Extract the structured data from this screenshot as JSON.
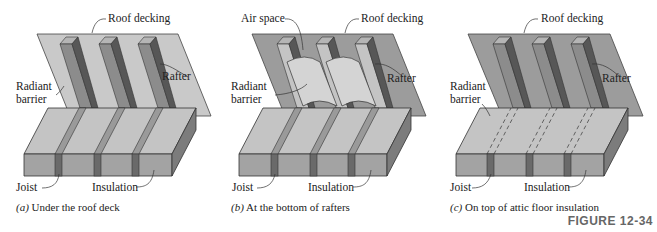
{
  "figure": {
    "number_label": "FIGURE 12-34",
    "colors": {
      "deck_light": "#c9c9c9",
      "deck_dark": "#9c9c9c",
      "rafter_face": "#8c8c8c",
      "rafter_side": "#575757",
      "insulation_top": "#c4c4c4",
      "insulation_front": "#a3a3a3",
      "insulation_side": "#7c7c7c",
      "joist": "#6a6a6a",
      "barrier": "#d4d4d4"
    }
  },
  "panels": [
    {
      "id": "a",
      "caption_letter": "(a)",
      "caption_text": " Under the roof deck",
      "labels": {
        "roof_decking": "Roof decking",
        "rafter": "Rafter",
        "radiant_barrier_line1": "Radiant",
        "radiant_barrier_line2": "barrier",
        "joist": "Joist",
        "insulation": "Insulation"
      }
    },
    {
      "id": "b",
      "caption_letter": "(b)",
      "caption_text": " At the bottom of rafters",
      "labels": {
        "air_space": "Air space",
        "roof_decking": "Roof decking",
        "rafter": "Rafter",
        "radiant_barrier_line1": "Radiant",
        "radiant_barrier_line2": "barrier",
        "joist": "Joist",
        "insulation": "Insulation"
      }
    },
    {
      "id": "c",
      "caption_letter": "(c)",
      "caption_text": " On top of attic floor insulation",
      "labels": {
        "roof_decking": "Roof decking",
        "rafter": "Rafter",
        "radiant_barrier_line1": "Radiant",
        "radiant_barrier_line2": "barrier",
        "joist": "Joist",
        "insulation": "Insulation"
      }
    }
  ]
}
